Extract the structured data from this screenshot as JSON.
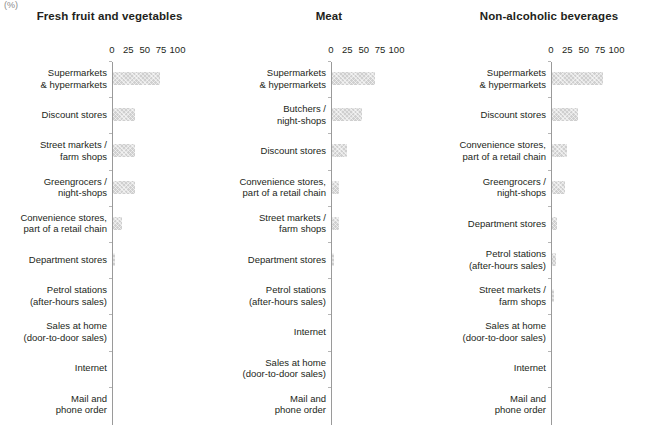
{
  "unit_note": "(%)",
  "axis": {
    "ticks": [
      0,
      25,
      50,
      75,
      100
    ],
    "tick_labels": [
      "0",
      "25",
      "50",
      "75",
      "100"
    ],
    "min": 0,
    "max": 100
  },
  "colors": {
    "bar_fill": "#cfcfcf",
    "text": "#231f20",
    "axis": "#9a9a9a"
  },
  "chart_data": [
    {
      "type": "bar",
      "title": "Fresh fruit and vegetables",
      "orientation": "horizontal",
      "xlabel": "(%)",
      "ylabel": "",
      "xlim": [
        0,
        100
      ],
      "grid": false,
      "legend": "none",
      "categories": [
        "Supermarkets\n& hypermarkets",
        "Discount stores",
        "Street markets /\nfarm shops",
        "Greengrocers /\nnight-shops",
        "Convenience stores,\npart of a retail chain",
        "Department stores",
        "Petrol stations\n(after-hours sales)",
        "Sales at home\n(door-to-door sales)",
        "Internet",
        "Mail and\nphone order"
      ],
      "values": [
        72,
        34,
        33,
        33,
        13,
        2,
        0,
        0,
        0,
        0
      ]
    },
    {
      "type": "bar",
      "title": "Meat",
      "orientation": "horizontal",
      "xlabel": "(%)",
      "ylabel": "",
      "xlim": [
        0,
        100
      ],
      "grid": false,
      "legend": "none",
      "categories": [
        "Supermarkets\n& hypermarkets",
        "Butchers /\nnight-shops",
        "Discount stores",
        "Convenience stores,\npart of a retail chain",
        "Street markets /\nfarm shops",
        "Department stores",
        "Petrol stations\n(after-hours sales)",
        "Internet",
        "Sales at home\n(door-to-door sales)",
        "Mail and\nphone order"
      ],
      "values": [
        66,
        46,
        23,
        10,
        10,
        3,
        0,
        0,
        0,
        0
      ]
    },
    {
      "type": "bar",
      "title": "Non-alcoholic beverages",
      "orientation": "horizontal",
      "xlabel": "(%)",
      "ylabel": "",
      "xlim": [
        0,
        100
      ],
      "grid": false,
      "legend": "none",
      "categories": [
        "Supermarkets\n& hypermarkets",
        "Discount stores",
        "Convenience stores,\npart of a retail chain",
        "Greengrocers /\nnight-shops",
        "Department stores",
        "Petrol stations\n(after-hours sales)",
        "Street markets /\nfarm shops",
        "Sales at home\n(door-to-door sales)",
        "Internet",
        "Mail and\nphone order"
      ],
      "values": [
        78,
        40,
        23,
        20,
        7,
        6,
        3,
        0,
        0,
        0
      ]
    }
  ]
}
